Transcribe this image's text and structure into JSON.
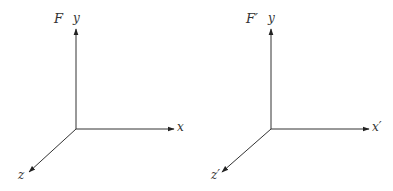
{
  "diagram": {
    "type": "coordinate-frames",
    "stroke_color": "#333333",
    "frames": [
      {
        "name": "F",
        "label": "F",
        "axes": {
          "x": "x",
          "y": "y",
          "z": "z"
        },
        "origin": [
          76,
          129
        ],
        "x_end": [
          174,
          129
        ],
        "y_end": [
          76,
          28
        ],
        "z_end": [
          29,
          172
        ]
      },
      {
        "name": "F-prime",
        "label": "F′",
        "axes": {
          "x": "x′",
          "y": "y",
          "z": "z′"
        },
        "origin": [
          271,
          129
        ],
        "x_end": [
          369,
          129
        ],
        "y_end": [
          271,
          28
        ],
        "z_end": [
          222,
          172
        ]
      }
    ]
  }
}
